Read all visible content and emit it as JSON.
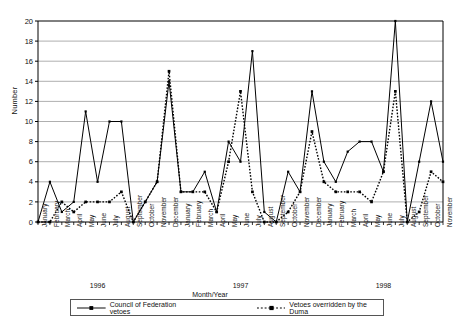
{
  "axis": {
    "ylabel": "Number",
    "xlabel": "Month/Year",
    "yticks": [
      "0",
      "2",
      "4",
      "6",
      "8",
      "10",
      "12",
      "14",
      "16",
      "18",
      "20"
    ]
  },
  "legend": {
    "series1_label": "Council of Federation vetoes",
    "series2_label": "Vetoes overridden by the Duma",
    "marker1": "solid-line-marker",
    "marker2": "dotted-line-marker"
  },
  "years": [
    {
      "label": "1996",
      "center_month_index": 5
    },
    {
      "label": "1997",
      "center_month_index": 17
    },
    {
      "label": "1998",
      "center_month_index": 29
    }
  ],
  "chart_data": {
    "type": "line",
    "title": "",
    "xlabel": "Month/Year",
    "ylabel": "Number",
    "ylim": [
      0,
      20
    ],
    "ytick_step": 2,
    "grid": true,
    "legend_position": "bottom",
    "categories": [
      "January 1996",
      "February 1996",
      "March 1996",
      "April 1996",
      "May 1996",
      "June 1996",
      "July 1996",
      "August 1996",
      "September 1996",
      "October 1996",
      "November 1996",
      "December 1996",
      "January 1997",
      "February 1997",
      "March 1997",
      "April 1997",
      "May 1997",
      "June 1997",
      "July 1997",
      "August 1997",
      "September 1997",
      "October 1997",
      "November 1997",
      "December 1997",
      "January 1998",
      "February 1998",
      "March 1998",
      "April 1998",
      "May 1998",
      "June 1998",
      "July 1998",
      "August 1998",
      "September 1998",
      "October 1998",
      "November 1998"
    ],
    "tick_labels": [
      "January",
      "February",
      "March",
      "April",
      "May",
      "June",
      "July",
      "August",
      "September",
      "October",
      "November",
      "December",
      "January",
      "February",
      "March",
      "April",
      "May",
      "June",
      "July",
      "August",
      "September",
      "October",
      "November",
      "December",
      "January",
      "February",
      "March",
      "April",
      "May",
      "June",
      "July",
      "August",
      "September",
      "October",
      "November"
    ],
    "series": [
      {
        "name": "Council of Federation vetoes",
        "style": "solid",
        "color": "#000000",
        "values": [
          0,
          4,
          1,
          2,
          11,
          4,
          10,
          10,
          0,
          2,
          4,
          14,
          3,
          3,
          5,
          1,
          8,
          6,
          17,
          1,
          0,
          5,
          3,
          13,
          6,
          4,
          7,
          8,
          8,
          5,
          20,
          0,
          6,
          12,
          6
        ]
      },
      {
        "name": "Vetoes overridden by the Duma",
        "style": "dotted",
        "color": "#000000",
        "values": [
          0,
          0,
          2,
          1,
          2,
          2,
          2,
          3,
          0,
          2,
          4,
          15,
          3,
          3,
          3,
          1,
          6,
          13,
          3,
          0,
          0,
          1,
          3,
          9,
          4,
          3,
          3,
          3,
          2,
          5,
          13,
          0,
          1,
          5,
          4
        ]
      }
    ]
  }
}
